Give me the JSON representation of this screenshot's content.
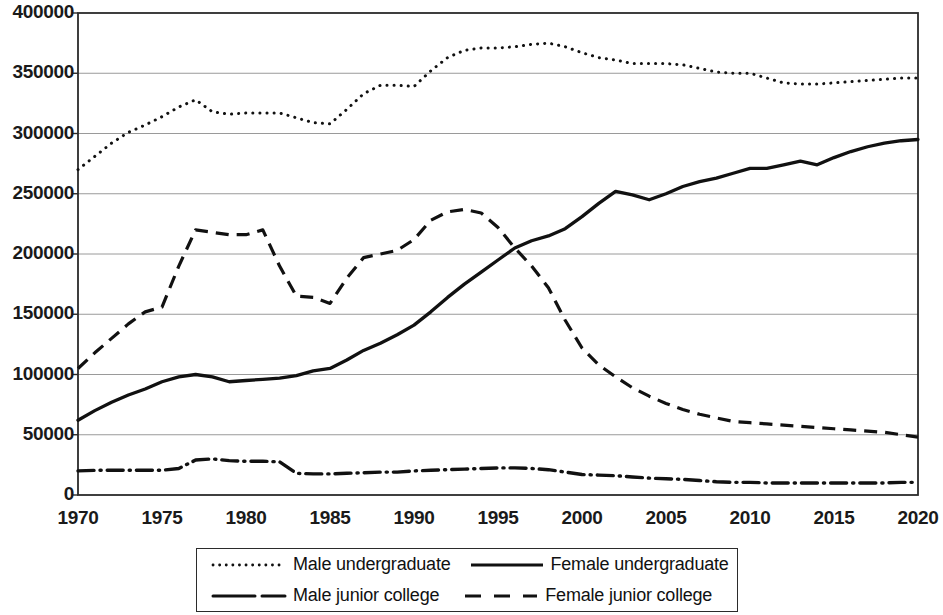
{
  "chart_data": {
    "type": "line",
    "title": "",
    "subtitle": "",
    "xlabel": "",
    "ylabel": "",
    "xlim": [
      1970,
      2020
    ],
    "ylim": [
      0,
      400000
    ],
    "grid": true,
    "legend_position": "bottom",
    "y_ticks": [
      0,
      50000,
      100000,
      150000,
      200000,
      250000,
      300000,
      350000,
      400000
    ],
    "y_tick_labels": [
      "0",
      "50000",
      "100000",
      "150000",
      "200000",
      "250000",
      "300000",
      "350000",
      "400000"
    ],
    "x_ticks": [
      1970,
      1975,
      1980,
      1985,
      1990,
      1995,
      2000,
      2005,
      2010,
      2015,
      2020
    ],
    "x_tick_labels": [
      "1970",
      "1975",
      "1980",
      "1985",
      "1990",
      "1995",
      "2000",
      "2005",
      "2010",
      "2015",
      "2020"
    ],
    "x": [
      1970,
      1971,
      1972,
      1973,
      1974,
      1975,
      1976,
      1977,
      1978,
      1979,
      1980,
      1981,
      1982,
      1983,
      1984,
      1985,
      1986,
      1987,
      1988,
      1989,
      1990,
      1991,
      1992,
      1993,
      1994,
      1995,
      1996,
      1997,
      1998,
      1999,
      2000,
      2001,
      2002,
      2003,
      2004,
      2005,
      2006,
      2007,
      2008,
      2009,
      2010,
      2011,
      2012,
      2013,
      2014,
      2015,
      2016,
      2017,
      2018,
      2019,
      2020
    ],
    "series": [
      {
        "name": "Male undergraduate",
        "style": "dotted",
        "color": "#111111",
        "values": [
          270000,
          281000,
          292000,
          301000,
          307000,
          314000,
          322000,
          328000,
          318000,
          316000,
          317000,
          317000,
          317000,
          313000,
          309000,
          308000,
          320000,
          333000,
          340000,
          340000,
          339000,
          352000,
          363000,
          369000,
          371000,
          371000,
          372000,
          374000,
          375000,
          372000,
          367000,
          363000,
          361000,
          358000,
          358000,
          358000,
          357000,
          354000,
          351000,
          350000,
          350000,
          346000,
          342000,
          341000,
          341000,
          342000,
          343000,
          344000,
          345000,
          346000,
          346000
        ]
      },
      {
        "name": "Female undergraduate",
        "style": "solid",
        "color": "#111111",
        "values": [
          62000,
          70000,
          77000,
          83000,
          88000,
          94000,
          98000,
          100000,
          98000,
          94000,
          95000,
          96000,
          97000,
          99000,
          103000,
          105000,
          112000,
          120000,
          126000,
          133000,
          141000,
          152000,
          164000,
          175000,
          185000,
          195000,
          205000,
          211000,
          215000,
          221000,
          231000,
          242000,
          252000,
          249000,
          245000,
          250000,
          256000,
          260000,
          263000,
          267000,
          271000,
          271000,
          274000,
          277000,
          274000,
          280000,
          285000,
          289000,
          292000,
          294000,
          295000
        ]
      },
      {
        "name": "Male junior college",
        "style": "dashdot",
        "color": "#111111",
        "values": [
          20000,
          20500,
          20500,
          20500,
          20500,
          20500,
          22000,
          29000,
          30000,
          28500,
          28000,
          28000,
          27500,
          18000,
          17500,
          17500,
          18000,
          18500,
          19000,
          19000,
          20000,
          20500,
          21000,
          21500,
          22000,
          22500,
          22500,
          22000,
          21000,
          19000,
          17000,
          16500,
          16000,
          15000,
          14000,
          13500,
          13000,
          12000,
          11000,
          10500,
          10500,
          10000,
          10000,
          10000,
          10000,
          10000,
          10000,
          10000,
          10000,
          10500,
          10500
        ]
      },
      {
        "name": "Female junior college",
        "style": "dashed",
        "color": "#111111",
        "values": [
          105000,
          118000,
          130000,
          142000,
          152000,
          156000,
          190000,
          220000,
          218000,
          216000,
          216000,
          220000,
          190000,
          165000,
          164000,
          159000,
          180000,
          197000,
          200000,
          203000,
          212000,
          228000,
          235000,
          237000,
          234000,
          222000,
          205000,
          190000,
          172000,
          145000,
          122000,
          108000,
          98000,
          89000,
          82000,
          76000,
          71000,
          67000,
          64000,
          61000,
          60000,
          59000,
          58000,
          57000,
          56000,
          55000,
          54000,
          53000,
          52000,
          50000,
          48000
        ]
      }
    ]
  },
  "legend": {
    "items": [
      {
        "label": "Male undergraduate",
        "style": "dotted"
      },
      {
        "label": "Female undergraduate",
        "style": "solid"
      },
      {
        "label": "Male junior college",
        "style": "dashdot"
      },
      {
        "label": "Female junior college",
        "style": "dashed"
      }
    ]
  },
  "axis_color": "#2b2b2b",
  "grid_color": "#9a9a9a"
}
